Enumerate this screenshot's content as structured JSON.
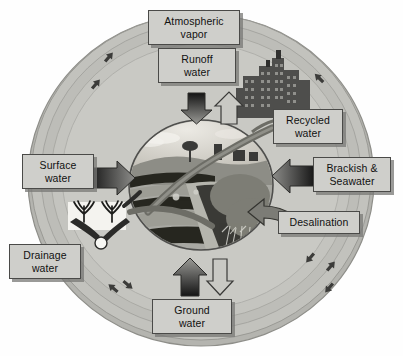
{
  "diagram": {
    "center_scene": "agricultural-field-with-furrows-tree-and-crops",
    "background_color": "#fefefe",
    "ring_color": "#b9b9b4",
    "ring_inner_color": "#c6c6c1",
    "label_fill": "#cfcfcb",
    "label_border": "#4a4a48",
    "arrow_dark": "#2b2b2b",
    "arrow_outline": "#3a3a3a"
  },
  "labels": {
    "atmospheric_vapor": "Atmospheric\nvapor",
    "runoff_water": "Runoff\nwater",
    "recycled_water": "Recycled\nwater",
    "surface_water": "Surface\nwater",
    "brackish_seawater": "Brackish &\nSeawater",
    "desalination": "Desalination",
    "drainage_water": "Drainage\nwater",
    "ground_water": "Ground\nwater"
  },
  "arrows": {
    "top_down": "runoff-water-into-field",
    "top_up": "vapor-rising-from-field",
    "bottom_up": "ground-water-into-field",
    "bottom_down": "percolation-to-ground-water",
    "left_right": "surface-water-into-field",
    "right_left": "brackish-seawater-into-field",
    "desalination_curve": "desalination-into-field",
    "recycled_curve": "recycled-water-into-field"
  },
  "ring_arrows": {
    "count": 9,
    "meaning": "circulation-direction-markers"
  }
}
